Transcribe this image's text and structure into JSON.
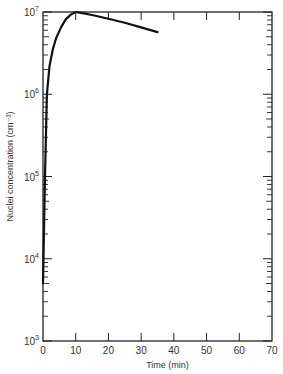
{
  "chart_data": {
    "type": "line",
    "title": "",
    "xlabel": "Time (min)",
    "ylabel": "Nuclei concentration (cm⁻³)",
    "xlim": [
      0,
      70
    ],
    "ylim": [
      1000,
      10000000
    ],
    "yscale": "log",
    "grid": false,
    "legend": null,
    "x_ticks": [
      "0",
      "10",
      "20",
      "30",
      "40",
      "50",
      "60",
      "70"
    ],
    "y_ticks": [
      "10^3",
      "10^4",
      "10^5",
      "10^6",
      "10^7"
    ],
    "series": [
      {
        "name": "Nuclei concentration",
        "x": [
          0,
          0.6,
          1.2,
          2.0,
          3.0,
          4.0,
          5.5,
          7.0,
          8.5,
          10,
          12,
          15,
          20,
          25,
          30,
          35
        ],
        "y": [
          5000,
          100000,
          1000000,
          2200000,
          3500000,
          4800000,
          6500000,
          8200000,
          9300000,
          10000000,
          9700000,
          9200000,
          8300000,
          7400000,
          6500000,
          5700000
        ]
      }
    ]
  }
}
